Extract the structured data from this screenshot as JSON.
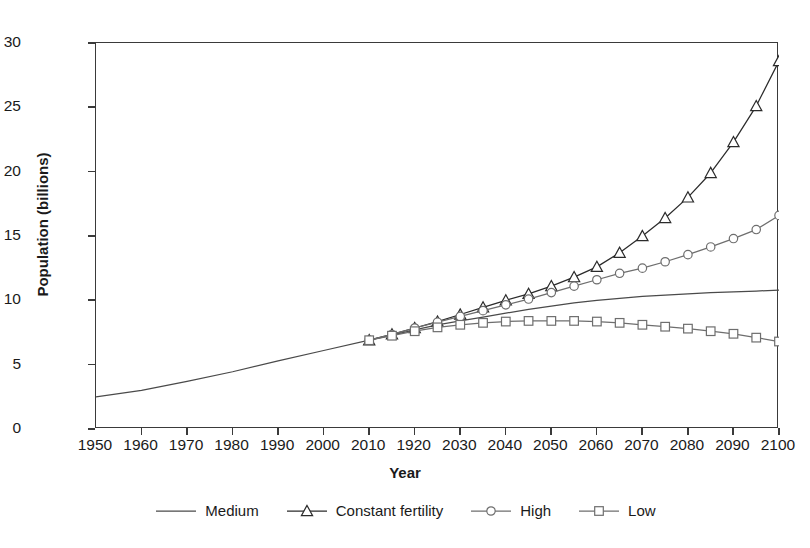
{
  "chart_data": {
    "type": "line",
    "title": "",
    "xlabel": "Year",
    "ylabel": "Population (billions)",
    "xlim": [
      1950,
      2100
    ],
    "ylim": [
      0,
      30
    ],
    "grid": false,
    "legend_position": "bottom",
    "x_tick_labels": [
      "1950",
      "1960",
      "1970",
      "1980",
      "1990",
      "2000",
      "2010",
      "1920",
      "2030",
      "2040",
      "2050",
      "2060",
      "2070",
      "2080",
      "2090",
      "2100"
    ],
    "x_tick_values": [
      1950,
      1960,
      1970,
      1980,
      1990,
      2000,
      2010,
      2020,
      2030,
      2040,
      2050,
      2060,
      2070,
      2080,
      2090,
      2100
    ],
    "y_tick_labels": [
      "0",
      "5",
      "10",
      "15",
      "20",
      "25",
      "30"
    ],
    "y_tick_values": [
      0,
      5,
      10,
      15,
      20,
      25,
      30
    ],
    "series": [
      {
        "name": "Medium",
        "marker": "none",
        "color": "#4a4a4a",
        "x": [
          1950,
          1960,
          1970,
          1980,
          1990,
          2000,
          2010,
          2015,
          2020,
          2025,
          2030,
          2035,
          2040,
          2045,
          2050,
          2055,
          2060,
          2065,
          2070,
          2075,
          2080,
          2085,
          2090,
          2095,
          2100
        ],
        "values": [
          2.5,
          3.0,
          3.7,
          4.45,
          5.3,
          6.1,
          6.9,
          7.3,
          7.7,
          8.1,
          8.4,
          8.7,
          9.0,
          9.3,
          9.55,
          9.8,
          10.0,
          10.15,
          10.3,
          10.4,
          10.5,
          10.6,
          10.65,
          10.72,
          10.8
        ]
      },
      {
        "name": "Constant fertility",
        "marker": "triangle",
        "color": "#2b2b2b",
        "x": [
          2010,
          2015,
          2020,
          2025,
          2030,
          2035,
          2040,
          2045,
          2050,
          2055,
          2060,
          2065,
          2070,
          2075,
          2080,
          2085,
          2090,
          2095,
          2100
        ],
        "values": [
          6.9,
          7.35,
          7.85,
          8.35,
          8.9,
          9.45,
          10.0,
          10.5,
          11.1,
          11.8,
          12.6,
          13.7,
          15.0,
          16.4,
          18.0,
          19.9,
          22.3,
          25.1,
          28.6
        ]
      },
      {
        "name": "High",
        "marker": "circle",
        "color": "#6e6e6e",
        "x": [
          2010,
          2015,
          2020,
          2025,
          2030,
          2035,
          2040,
          2045,
          2050,
          2055,
          2060,
          2065,
          2070,
          2075,
          2080,
          2085,
          2090,
          2095,
          2100
        ],
        "values": [
          6.9,
          7.35,
          7.85,
          8.3,
          8.75,
          9.2,
          9.65,
          10.1,
          10.6,
          11.1,
          11.6,
          12.1,
          12.5,
          13.0,
          13.55,
          14.15,
          14.8,
          15.5,
          16.6
        ]
      },
      {
        "name": "Low",
        "marker": "square",
        "color": "#6e6e6e",
        "x": [
          2010,
          2015,
          2020,
          2025,
          2030,
          2035,
          2040,
          2045,
          2050,
          2055,
          2060,
          2065,
          2070,
          2075,
          2080,
          2085,
          2090,
          2095,
          2100
        ],
        "values": [
          6.9,
          7.25,
          7.6,
          7.9,
          8.1,
          8.25,
          8.35,
          8.4,
          8.4,
          8.4,
          8.35,
          8.25,
          8.1,
          7.95,
          7.8,
          7.6,
          7.4,
          7.1,
          6.8
        ]
      }
    ]
  },
  "legend": {
    "items": [
      {
        "label": "Medium",
        "marker": "none"
      },
      {
        "label": "Constant fertility",
        "marker": "triangle"
      },
      {
        "label": "High",
        "marker": "circle"
      },
      {
        "label": "Low",
        "marker": "square"
      }
    ]
  }
}
